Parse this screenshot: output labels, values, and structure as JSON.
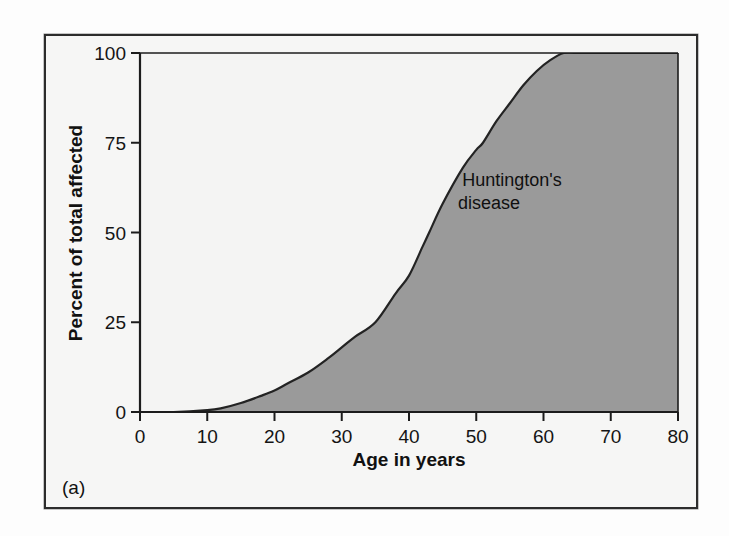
{
  "figure": {
    "panel_label": "(a)",
    "background_color": "#f4f4f3",
    "frame_color": "#2c2c2c"
  },
  "chart_data": {
    "type": "area",
    "title": "",
    "subtitle": "",
    "xlabel": "Age in years",
    "ylabel": "Percent of total affected",
    "xlim": [
      0,
      80
    ],
    "ylim": [
      0,
      100
    ],
    "grid": false,
    "legend_position": "inside-right",
    "xticks": [
      "0",
      "10",
      "20",
      "30",
      "40",
      "50",
      "60",
      "70",
      "80"
    ],
    "xtick_values": [
      0,
      10,
      20,
      30,
      40,
      50,
      60,
      70,
      80
    ],
    "yticks": [
      "0",
      "25",
      "50",
      "75",
      "100"
    ],
    "ytick_values": [
      0,
      25,
      50,
      75,
      100
    ],
    "series": [
      {
        "name": "Huntington's disease",
        "annotation": "Huntington's\ndisease",
        "annotation_line1": "Huntington's",
        "annotation_line2": "disease",
        "fill_color": "#9a9a9a",
        "line_color": "#232323",
        "x": [
          0,
          5,
          10,
          12,
          15,
          18,
          20,
          22,
          25,
          28,
          30,
          32,
          35,
          38,
          40,
          42,
          43,
          45,
          48,
          50,
          51,
          53,
          55,
          57,
          59,
          61,
          63,
          65,
          70,
          75,
          80
        ],
        "values": [
          0,
          0,
          0.5,
          1,
          2.5,
          4.5,
          6,
          8,
          11,
          15,
          18,
          21,
          25,
          33,
          38,
          46,
          50,
          58,
          68,
          73,
          75,
          81,
          86,
          91,
          95,
          98,
          100,
          100,
          100,
          100,
          100
        ]
      }
    ]
  }
}
